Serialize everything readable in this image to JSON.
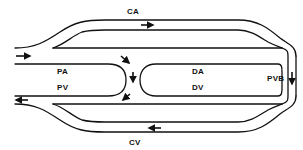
{
  "diagram": {
    "type": "circulation schematic",
    "colors": {
      "stroke": "#111111",
      "background": "#ffffff"
    },
    "labels": {
      "ca": "CA",
      "pa": "PA",
      "pv": "PV",
      "da": "DA",
      "dv": "DV",
      "pvb": "PVB",
      "cv": "CV"
    },
    "flow_arrows": [
      {
        "id": "inlet",
        "direction": "right",
        "location": "left inlet"
      },
      {
        "id": "ca",
        "direction": "right",
        "location": "CA channel"
      },
      {
        "id": "center-top",
        "direction": "down-right",
        "location": "junction top"
      },
      {
        "id": "center-mid",
        "direction": "down",
        "location": "junction center"
      },
      {
        "id": "center-bottom",
        "direction": "down-left",
        "location": "junction bottom"
      },
      {
        "id": "pvb",
        "direction": "down",
        "location": "PVB right loop"
      },
      {
        "id": "cv",
        "direction": "left",
        "location": "CV channel"
      },
      {
        "id": "outlet",
        "direction": "left",
        "location": "left outlet"
      }
    ]
  }
}
